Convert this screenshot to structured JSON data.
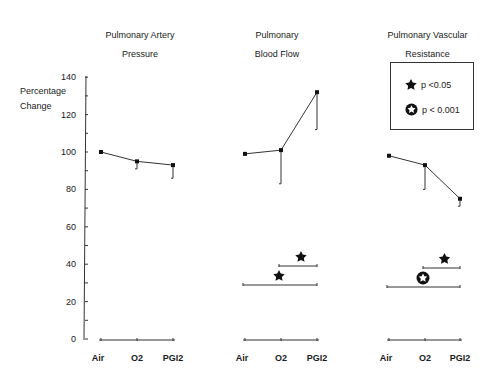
{
  "chart_data": [
    {
      "type": "line",
      "title": "Pulmonary Artery Pressure",
      "title_lines": [
        "Pulmonary Artery",
        "Pressure"
      ],
      "ylabel": "Percentage Change",
      "ylim": [
        0,
        140
      ],
      "yticks": [
        0,
        20,
        40,
        60,
        80,
        100,
        120,
        140
      ],
      "categories": [
        "Air",
        "O2",
        "PGI2"
      ],
      "series": [
        {
          "name": "Pulmonary Artery Pressure",
          "values": [
            100,
            95,
            93
          ],
          "error_lower": [
            null,
            91,
            86
          ]
        }
      ],
      "significance": []
    },
    {
      "type": "line",
      "title": "Pulmonary Blood Flow",
      "title_lines": [
        "Pulmonary",
        "Blood Flow"
      ],
      "categories": [
        "Air",
        "O2",
        "PGI2"
      ],
      "series": [
        {
          "name": "Pulmonary Blood Flow",
          "values": [
            99,
            101,
            132
          ],
          "error_lower": [
            null,
            83,
            112
          ]
        }
      ],
      "significance": [
        {
          "from": "O2",
          "to": "PGI2",
          "symbol": "filled-star",
          "meaning": "p<0.05"
        },
        {
          "from": "Air",
          "to": "PGI2",
          "symbol": "filled-star",
          "meaning": "p<0.05"
        }
      ]
    },
    {
      "type": "line",
      "title": "Pulmonary Vascular Resistance",
      "title_lines": [
        "Pulmonary Vascular",
        "Resistance"
      ],
      "categories": [
        "Air",
        "O2",
        "PGI2"
      ],
      "series": [
        {
          "name": "Pulmonary Vascular Resistance",
          "values": [
            98,
            93,
            75
          ],
          "error_lower": [
            null,
            80,
            71
          ]
        }
      ],
      "significance": [
        {
          "from": "O2",
          "to": "PGI2",
          "symbol": "filled-star",
          "meaning": "p<0.05"
        },
        {
          "from": "Air",
          "to": "PGI2",
          "symbol": "outlined-star",
          "meaning": "p<0.001"
        }
      ]
    }
  ],
  "titles": {
    "pap_line1": "Pulmonary Artery",
    "pap_line2": "Pressure",
    "pbf_line1": "Pulmonary",
    "pbf_line2": "Blood Flow",
    "pvr_line1": "Pulmonary Vascular",
    "pvr_line2": "Resistance"
  },
  "axis": {
    "ylabel_line1": "Percentage",
    "ylabel_line2": "Change",
    "ticks": [
      "0",
      "20",
      "40",
      "60",
      "80",
      "100",
      "120",
      "140"
    ]
  },
  "categories": [
    "Air",
    "O2",
    "PGI2"
  ],
  "legend": {
    "items": [
      {
        "icon": "filled-star-icon",
        "label": "p <0.05"
      },
      {
        "icon": "outlined-star-icon",
        "label": "p < 0.001"
      }
    ]
  }
}
